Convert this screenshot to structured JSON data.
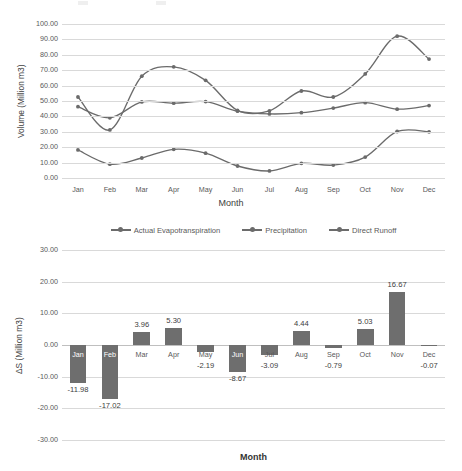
{
  "chart_data": [
    {
      "type": "line",
      "title": "",
      "xlabel": "Month",
      "ylabel": "Volume (Million m3)",
      "ylim": [
        0,
        100
      ],
      "ytick_step": 10,
      "grid": true,
      "legend_position": "bottom",
      "categories": [
        "Jan",
        "Feb",
        "Mar",
        "Apr",
        "May",
        "Jun",
        "Jul",
        "Aug",
        "Sep",
        "Oct",
        "Nov",
        "Dec"
      ],
      "ytick_labels": [
        "0.00",
        "10.00",
        "20.00",
        "30.00",
        "40.00",
        "50.00",
        "60.00",
        "70.00",
        "80.00",
        "90.00",
        "100.00"
      ],
      "series": [
        {
          "name": "Actual Evapotranspiration",
          "color": "#6b6b6b",
          "values": [
            46.3,
            39.1,
            49.4,
            48.6,
            49.6,
            43.4,
            41.6,
            42.4,
            45.4,
            48.9,
            44.7,
            47.0
          ]
        },
        {
          "name": "Precipitation",
          "color": "#6b6b6b",
          "values": [
            52.6,
            31.2,
            66.1,
            72.2,
            63.4,
            43.9,
            43.6,
            56.5,
            52.6,
            67.6,
            92.1,
            77.2
          ]
        },
        {
          "name": "Direct Runoff",
          "color": "#6b6b6b",
          "values": [
            18.2,
            9.0,
            13.0,
            18.6,
            16.1,
            7.8,
            4.6,
            9.5,
            8.4,
            13.6,
            30.2,
            30.0
          ]
        }
      ]
    },
    {
      "type": "bar",
      "title": "",
      "xlabel": "Month",
      "ylabel": "ΔS (Million m3)",
      "ylim": [
        -30,
        30
      ],
      "ytick_step": 10,
      "grid": true,
      "bar_color": "#6e6e6e",
      "categories": [
        "Jan",
        "Feb",
        "Mar",
        "Apr",
        "May",
        "Jun",
        "Jul",
        "Aug",
        "Sep",
        "Oct",
        "Nov",
        "Dec"
      ],
      "ytick_labels": [
        "-30.00",
        "-20.00",
        "-10.00",
        "0.00",
        "10.00",
        "20.00",
        "30.00"
      ],
      "values": [
        -11.98,
        -17.02,
        3.96,
        5.3,
        -2.19,
        -8.67,
        -3.09,
        4.44,
        -0.79,
        5.03,
        16.67,
        -0.07
      ],
      "data_labels": [
        "-11.98",
        "-17.02",
        "3.96",
        "5.30",
        "-2.19",
        "-8.67",
        "-3.09",
        "4.44",
        "-0.79",
        "5.03",
        "16.67",
        "-0.07"
      ]
    }
  ]
}
